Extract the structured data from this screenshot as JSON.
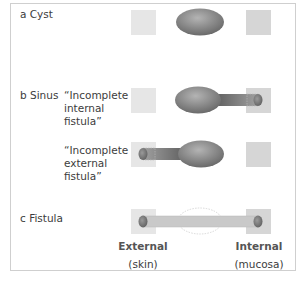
{
  "rows": {
    "cyst": {
      "letter": "a",
      "name": "Cyst"
    },
    "sinus": {
      "letter": "b",
      "name": "Sinus",
      "variants": [
        {
          "line1": "“Incomplete",
          "line2": "internal",
          "line3": "fistula”"
        },
        {
          "line1": "“Incomplete",
          "line2": "external",
          "line3": "fistula”"
        }
      ]
    },
    "fistula": {
      "letter": "c",
      "name": "Fistula"
    }
  },
  "axis_labels": {
    "left": {
      "title": "External",
      "sub": "(skin)"
    },
    "right": {
      "title": "Internal",
      "sub": "(mucosa)"
    }
  },
  "colors": {
    "frame_border": "#cfcfcf",
    "skin_square": "#e3e3e3",
    "mucosa_square": "#d4d4d4",
    "cavity_dark": "#6e6e6e",
    "cavity_light": "#a9a9a9",
    "tract_dark": "#5f5f5f",
    "fistula_tract": "#c6c6c6"
  }
}
